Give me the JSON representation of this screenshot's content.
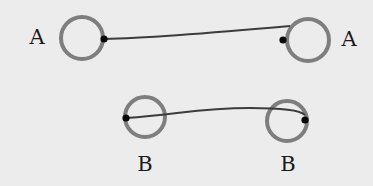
{
  "diagram": {
    "colors": {
      "background": "#ececec",
      "ring": "#7e7e7e",
      "string": "#3c3c3c",
      "dot": "#0a0a0a",
      "label": "#1a1a1a"
    },
    "pairs": [
      {
        "name": "A",
        "rings": [
          {
            "label": "A",
            "cx": 82,
            "cy": 38,
            "r": 21,
            "label_x": 37,
            "label_y": 37
          },
          {
            "label": "A",
            "cx": 308,
            "cy": 40,
            "r": 21,
            "label_x": 349,
            "label_y": 39
          }
        ],
        "dots": [
          {
            "x": 104,
            "y": 39
          },
          {
            "x": 283,
            "y": 40
          }
        ],
        "string_path": "M104,39 C150,38 200,34 290,26"
      },
      {
        "name": "B",
        "rings": [
          {
            "label": "B",
            "cx": 145,
            "cy": 117,
            "r": 20,
            "label_x": 145,
            "label_y": 164
          },
          {
            "label": "B",
            "cx": 287,
            "cy": 121,
            "r": 20,
            "label_x": 288,
            "label_y": 164
          }
        ],
        "dots": [
          {
            "x": 126,
            "y": 118
          },
          {
            "x": 305,
            "y": 120
          }
        ],
        "string_path": "M126,118 C180,114 200,108 250,108 C280,108 300,110 305,115"
      }
    ]
  }
}
